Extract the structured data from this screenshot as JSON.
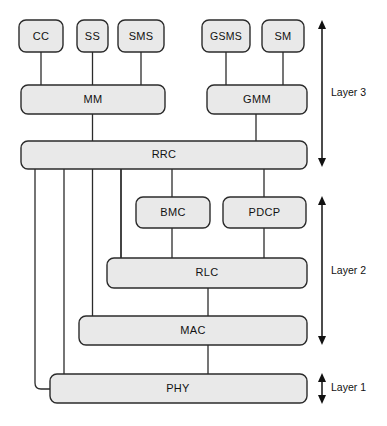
{
  "diagram": {
    "background_color": "#ffffff",
    "box_fill_color": "#e9e9e9",
    "box_stroke_color": "#2b2b2b",
    "text_color": "#111111",
    "nodes": [
      {
        "id": "cc",
        "label": "CC",
        "x": 19,
        "y": 20,
        "w": 44,
        "h": 32
      },
      {
        "id": "ss",
        "label": "SS",
        "x": 77,
        "y": 20,
        "w": 31,
        "h": 32
      },
      {
        "id": "sms",
        "label": "SMS",
        "x": 118,
        "y": 20,
        "w": 46,
        "h": 32
      },
      {
        "id": "gsms",
        "label": "GSMS",
        "x": 202,
        "y": 20,
        "w": 48,
        "h": 32
      },
      {
        "id": "sm",
        "label": "SM",
        "x": 262,
        "y": 20,
        "w": 42,
        "h": 32
      },
      {
        "id": "mm",
        "label": "MM",
        "x": 21,
        "y": 85,
        "w": 144,
        "h": 29
      },
      {
        "id": "gmm",
        "label": "GMM",
        "x": 207,
        "y": 85,
        "w": 100,
        "h": 29
      },
      {
        "id": "rrc",
        "label": "RRC",
        "x": 21,
        "y": 141,
        "w": 286,
        "h": 28
      },
      {
        "id": "bmc",
        "label": "BMC",
        "x": 136,
        "y": 197,
        "w": 74,
        "h": 31
      },
      {
        "id": "pdcp",
        "label": "PDCP",
        "x": 223,
        "y": 197,
        "w": 83,
        "h": 31
      },
      {
        "id": "rlc",
        "label": "RLC",
        "x": 107,
        "y": 258,
        "w": 200,
        "h": 30
      },
      {
        "id": "mac",
        "label": "MAC",
        "x": 79,
        "y": 316,
        "w": 228,
        "h": 29
      },
      {
        "id": "phy",
        "label": "PHY",
        "x": 50,
        "y": 374,
        "w": 257,
        "h": 29
      }
    ],
    "layers": [
      {
        "id": "layer3",
        "label": "Layer 3",
        "arrow_x": 322,
        "y_top": 21,
        "y_bottom": 166,
        "label_x": 331,
        "label_y": 93
      },
      {
        "id": "layer2",
        "label": "Layer 2",
        "arrow_x": 322,
        "y_top": 197,
        "y_bottom": 344,
        "label_x": 331,
        "label_y": 271
      },
      {
        "id": "layer1",
        "label": "Layer 1",
        "arrow_x": 322,
        "y_top": 374,
        "y_bottom": 403,
        "label_x": 331,
        "label_y": 388
      }
    ],
    "connections": [
      {
        "from": "cc",
        "to": "mm",
        "name": "cc-to-mm"
      },
      {
        "from": "ss",
        "to": "mm",
        "name": "ss-to-mm"
      },
      {
        "from": "sms",
        "to": "mm",
        "name": "sms-to-mm"
      },
      {
        "from": "gsms",
        "to": "gmm",
        "name": "gsms-to-gmm"
      },
      {
        "from": "sm",
        "to": "gmm",
        "name": "sm-to-gmm"
      },
      {
        "from": "mm",
        "to": "rrc",
        "name": "mm-to-rrc"
      },
      {
        "from": "gmm",
        "to": "rrc",
        "name": "gmm-to-rrc"
      },
      {
        "from": "rrc",
        "to": "bmc",
        "name": "rrc-to-bmc"
      },
      {
        "from": "rrc",
        "to": "pdcp",
        "name": "rrc-to-pdcp"
      },
      {
        "from": "bmc",
        "to": "rlc",
        "name": "bmc-to-rlc"
      },
      {
        "from": "pdcp",
        "to": "rlc",
        "name": "pdcp-to-rlc"
      },
      {
        "from": "rrc",
        "to": "rlc",
        "name": "rrc-to-rlc-elbow"
      },
      {
        "from": "rrc",
        "to": "mac",
        "name": "rrc-to-mac-elbow"
      },
      {
        "from": "rrc",
        "to": "phy",
        "name": "rrc-to-phy-elbow"
      },
      {
        "from": "rlc",
        "to": "mac",
        "name": "rlc-to-mac"
      },
      {
        "from": "mac",
        "to": "phy",
        "name": "mac-to-phy"
      }
    ]
  }
}
